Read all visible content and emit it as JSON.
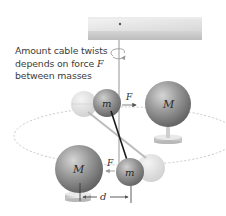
{
  "caption": {
    "line1": "Amount cable twists",
    "line2_prefix": "depends on force ",
    "line2_var": "F",
    "line3": "between masses"
  },
  "labels": {
    "small_mass": "m",
    "large_mass": "M",
    "force": "F",
    "distance": "d"
  },
  "colors": {
    "background": "#ffffff",
    "sphere_dark": "#6e6e6e",
    "sphere_light": "#d9d9d9",
    "ghost_sphere": "#e6e6e6",
    "plate_top": "#e8e8e8",
    "plate_side": "#c9c9c9",
    "orbit_dash": "#c8c8c8",
    "rod": "#1a1a1a",
    "text": "#3c3c3c"
  },
  "components": [
    "ceiling-plate",
    "torsion-cable",
    "twist-indicator",
    "torsion-rod",
    "small-mass-upper",
    "small-mass-lower",
    "large-mass-upper-right",
    "large-mass-lower-left",
    "orbit-path",
    "force-arrow-upper",
    "force-arrow-lower",
    "distance-dimension"
  ]
}
